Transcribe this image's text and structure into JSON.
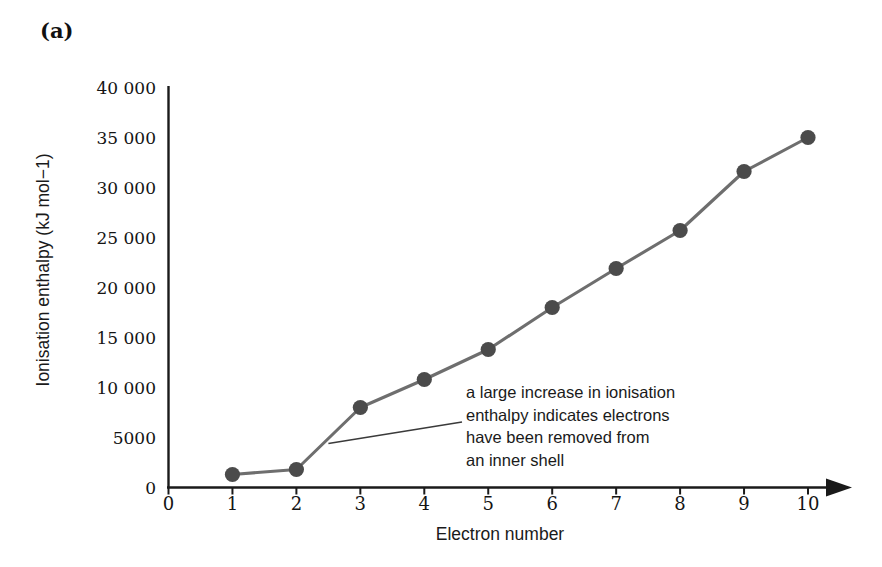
{
  "panel": {
    "label": "(a)"
  },
  "chart_data": {
    "type": "line",
    "title": "",
    "subtitle": "",
    "xlabel": "Electron number",
    "ylabel": "Ionisation enthalpy (kJ mol−1)",
    "x": [
      1,
      2,
      3,
      4,
      5,
      6,
      7,
      8,
      9,
      10
    ],
    "values": [
      1300,
      1800,
      8000,
      10800,
      13800,
      18000,
      21900,
      25700,
      31600,
      35000
    ],
    "series": [
      {
        "name": "Successive ionisation enthalpies",
        "values": [
          1300,
          1800,
          8000,
          10800,
          13800,
          18000,
          21900,
          25700,
          31600,
          35000
        ]
      }
    ],
    "xlim": [
      0,
      10
    ],
    "ylim": [
      0,
      40000
    ],
    "x_tick_labels": [
      "0",
      "1",
      "2",
      "3",
      "4",
      "5",
      "6",
      "7",
      "8",
      "9",
      "10"
    ],
    "y_tick_values": [
      0,
      5000,
      10000,
      15000,
      20000,
      25000,
      30000,
      35000,
      40000
    ],
    "y_tick_labels": [
      "0",
      "5000",
      "10 000",
      "15 000",
      "20 000",
      "25 000",
      "30 000",
      "35 000",
      "40 000"
    ],
    "grid": false,
    "legend": false,
    "legend_position": "none",
    "marker": "filled-circle",
    "marker_color": "#4b4b4b",
    "line_color": "#6e6e6e",
    "axis_color": "#1a1a1a",
    "x_axis_arrow": true,
    "annotations": [
      {
        "lines": [
          "a large increase in ionisation",
          "enthalpy indicates electrons",
          "have been removed from",
          "an inner shell"
        ],
        "points_to_x": 2.5,
        "points_to_y": 4400
      }
    ]
  },
  "axis_labels": {
    "y": [
      "40 000",
      "35 000",
      "30 000",
      "25 000",
      "20 000",
      "15 000",
      "10 000",
      "5000",
      "0"
    ],
    "x": [
      "0",
      "1",
      "2",
      "3",
      "4",
      "5",
      "6",
      "7",
      "8",
      "9",
      "10"
    ]
  },
  "annotation_text": {
    "line1": "a large increase in ionisation",
    "line2": "enthalpy indicates electrons",
    "line3": "have been removed from",
    "line4": "an inner shell"
  }
}
